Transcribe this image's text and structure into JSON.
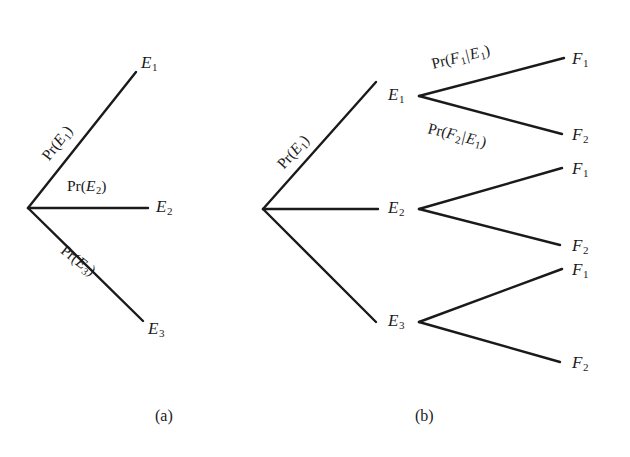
{
  "figure": {
    "width": 630,
    "height": 457,
    "background": "#ffffff",
    "line_color": "#1a1a1a",
    "text_color": "#1a1a1a"
  },
  "panels": [
    {
      "id": "panel-a",
      "caption": "(a)",
      "caption_x": 155,
      "caption_y": 408,
      "description": "single-stage probability tree with three first-stage outcomes",
      "root": {
        "x": 28,
        "y": 208
      },
      "branches": [
        {
          "name": "branch-e1",
          "x1": 28,
          "y1": 208,
          "x2": 136,
          "y2": 72,
          "label": "Pr(E1)",
          "label_parts": {
            "prefix": "Pr(",
            "var": "E",
            "sub": "1",
            "suffix": ")"
          },
          "label_x": 46,
          "label_y": 150,
          "label_rotation": -52
        },
        {
          "name": "branch-e2",
          "x1": 28,
          "y1": 208,
          "x2": 148,
          "y2": 208,
          "label": "Pr(E2)",
          "label_parts": {
            "prefix": "Pr(",
            "var": "E",
            "sub": "2",
            "suffix": ")"
          },
          "label_x": 67,
          "label_y": 178,
          "label_rotation": 0
        },
        {
          "name": "branch-e3",
          "x1": 28,
          "y1": 208,
          "x2": 143,
          "y2": 321,
          "label": "Pr(E3)",
          "label_parts": {
            "prefix": "Pr(",
            "var": "E",
            "sub": "3",
            "suffix": ")"
          },
          "label_x": 62,
          "label_y": 240,
          "label_rotation": 38
        }
      ],
      "nodes": [
        {
          "name": "node-e1",
          "label": "E",
          "sub": "1",
          "x": 141,
          "y": 54
        },
        {
          "name": "node-e2",
          "label": "E",
          "sub": "2",
          "x": 156,
          "y": 198
        },
        {
          "name": "node-e3",
          "label": "E",
          "sub": "3",
          "x": 148,
          "y": 320
        }
      ]
    },
    {
      "id": "panel-b",
      "caption": "(b)",
      "caption_x": 415,
      "caption_y": 408,
      "description": "two-stage probability tree with three first-stage outcomes each splitting into two second-stage outcomes",
      "root": {
        "x": 263,
        "y": 209
      },
      "branches": [
        {
          "name": "branch-e1",
          "x1": 263,
          "y1": 209,
          "x2": 376,
          "y2": 82,
          "label": "Pr(E1)",
          "label_parts": {
            "prefix": "Pr(",
            "var": "E",
            "sub": "1",
            "suffix": ")"
          },
          "label_x": 281,
          "label_y": 158,
          "label_rotation": -48
        },
        {
          "name": "branch-e2",
          "x1": 263,
          "y1": 209,
          "x2": 378,
          "y2": 209,
          "label": "",
          "label_parts": null,
          "label_x": 0,
          "label_y": 0,
          "label_rotation": 0
        },
        {
          "name": "branch-e3",
          "x1": 263,
          "y1": 209,
          "x2": 376,
          "y2": 322,
          "label": "",
          "label_parts": null,
          "label_x": 0,
          "label_y": 0,
          "label_rotation": 0
        },
        {
          "name": "branch-e1-f1",
          "x1": 419,
          "y1": 96,
          "x2": 564,
          "y2": 58,
          "label": "Pr(F1|E1)",
          "label_parts": {
            "prefix": "Pr(",
            "var": "F",
            "sub": "1",
            "bar": "|",
            "var2": "E",
            "sub2": "1",
            "suffix": ")"
          },
          "label_x": 432,
          "label_y": 56,
          "label_rotation": -14
        },
        {
          "name": "branch-e1-f2",
          "x1": 419,
          "y1": 96,
          "x2": 562,
          "y2": 134,
          "label": "Pr(F2|E1)",
          "label_parts": {
            "prefix": "Pr(",
            "var": "F",
            "sub": "2",
            "bar": "|",
            "var2": "E",
            "sub2": "1",
            "suffix": ")"
          },
          "label_x": 428,
          "label_y": 120,
          "label_rotation": 14
        },
        {
          "name": "branch-e2-f1",
          "x1": 419,
          "y1": 209,
          "x2": 562,
          "y2": 168,
          "label": "",
          "label_parts": null,
          "label_x": 0,
          "label_y": 0,
          "label_rotation": 0
        },
        {
          "name": "branch-e2-f2",
          "x1": 419,
          "y1": 209,
          "x2": 560,
          "y2": 245,
          "label": "",
          "label_parts": null,
          "label_x": 0,
          "label_y": 0,
          "label_rotation": 0
        },
        {
          "name": "branch-e3-f1",
          "x1": 419,
          "y1": 322,
          "x2": 562,
          "y2": 269,
          "label": "",
          "label_parts": null,
          "label_x": 0,
          "label_y": 0,
          "label_rotation": 0
        },
        {
          "name": "branch-e3-f2",
          "x1": 419,
          "y1": 322,
          "x2": 560,
          "y2": 362,
          "label": "",
          "label_parts": null,
          "label_x": 0,
          "label_y": 0,
          "label_rotation": 0
        }
      ],
      "nodes": [
        {
          "name": "node-e1",
          "label": "E",
          "sub": "1",
          "x": 388,
          "y": 86
        },
        {
          "name": "node-e2",
          "label": "E",
          "sub": "2",
          "x": 388,
          "y": 199
        },
        {
          "name": "node-e3",
          "label": "E",
          "sub": "3",
          "x": 388,
          "y": 312
        },
        {
          "name": "node-e1-f1",
          "label": "F",
          "sub": "1",
          "x": 572,
          "y": 50
        },
        {
          "name": "node-e1-f2",
          "label": "F",
          "sub": "2",
          "x": 572,
          "y": 126
        },
        {
          "name": "node-e2-f1",
          "label": "F",
          "sub": "1",
          "x": 572,
          "y": 160
        },
        {
          "name": "node-e2-f2",
          "label": "F",
          "sub": "2",
          "x": 572,
          "y": 237
        },
        {
          "name": "node-e3-f1",
          "label": "F",
          "sub": "1",
          "x": 572,
          "y": 261
        },
        {
          "name": "node-e3-f2",
          "label": "F",
          "sub": "2",
          "x": 572,
          "y": 354
        }
      ]
    }
  ]
}
